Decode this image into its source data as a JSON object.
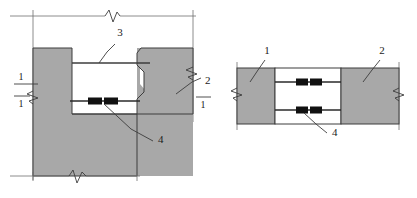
{
  "drawing": {
    "title": "Connection detail — two views",
    "colors": {
      "concrete_fill": "#a8a8a8",
      "outline": "#3c3c3c",
      "thin_line": "#6e6e6e",
      "connector_black": "#111111",
      "background": "#ffffff",
      "text": "#1a1a1a"
    },
    "views": {
      "left": {
        "name": "section-view",
        "callouts": [
          {
            "id": "left-callout-3",
            "text": "3",
            "x": 120,
            "y": 36
          },
          {
            "id": "left-callout-2",
            "text": "2",
            "x": 205,
            "y": 84
          },
          {
            "id": "left-callout-4",
            "text": "4",
            "x": 158,
            "y": 143
          }
        ],
        "section_marks": [
          {
            "id": "left-section-mark-top",
            "text": "1",
            "x": 21,
            "y": 80
          },
          {
            "id": "left-section-mark-bottom",
            "text": "1",
            "x": 21,
            "y": 104
          },
          {
            "id": "right-section-mark-bottom",
            "text": "1",
            "x": 203,
            "y": 105
          }
        ]
      },
      "right": {
        "name": "elevation-view",
        "callouts": [
          {
            "id": "right-callout-1",
            "text": "1",
            "x": 267,
            "y": 54
          },
          {
            "id": "right-callout-2",
            "text": "2",
            "x": 382,
            "y": 54
          },
          {
            "id": "right-callout-4",
            "text": "4",
            "x": 332,
            "y": 136
          }
        ]
      }
    },
    "legend_items": [
      {
        "number": "1",
        "name": "member-1"
      },
      {
        "number": "2",
        "name": "member-2"
      },
      {
        "number": "3",
        "name": "member-3"
      },
      {
        "number": "4",
        "name": "connector-4"
      }
    ]
  }
}
